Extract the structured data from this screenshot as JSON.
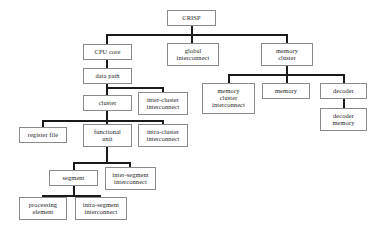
{
  "diagram": {
    "type": "tree",
    "background_color": "#ffffff",
    "box_border_color": "#8a8a8a",
    "edge_color": "#1a1a1a",
    "text_color": "#1c1c1c",
    "nodes": {
      "crisp": "CRISP",
      "cpu_core": "CPU core",
      "global_interconnect_l1": "global",
      "global_interconnect_l2": "interconnect",
      "memory_cluster_l1": "memory",
      "memory_cluster_l2": "cluster",
      "data_path": "data path",
      "memory_cluster_interconnect_l1": "memory",
      "memory_cluster_interconnect_l2": "cluster",
      "memory_cluster_interconnect_l3": "interconnect",
      "memory": "memory",
      "decoder": "decoder",
      "decoder_memory_l1": "decoder",
      "decoder_memory_l2": "memory",
      "cluster": "cluster",
      "inter_cluster_interconnect_l1": "inter-cluster",
      "inter_cluster_interconnect_l2": "interconnect",
      "register_file": "register file",
      "functional_unit_l1": "functional",
      "functional_unit_l2": "unit",
      "intra_cluster_interconnect_l1": "intra-cluster",
      "intra_cluster_interconnect_l2": "interconnect",
      "segment": "segment",
      "inter_segment_interconnect_l1": "inter-segment",
      "inter_segment_interconnect_l2": "interconnect",
      "processing_element_l1": "processing",
      "processing_element_l2": "element",
      "intra_segment_interconnect_l1": "intra-segment",
      "intra_segment_interconnect_l2": "interconnect"
    },
    "hierarchy": [
      {
        "parent": "CRISP",
        "children": [
          "CPU core",
          "global interconnect",
          "memory cluster"
        ]
      },
      {
        "parent": "CPU core",
        "children": [
          "data path"
        ]
      },
      {
        "parent": "data path",
        "children": [
          "cluster",
          "inter-cluster interconnect"
        ]
      },
      {
        "parent": "cluster",
        "children": [
          "register file",
          "functional unit",
          "intra-cluster interconnect"
        ]
      },
      {
        "parent": "functional unit",
        "children": [
          "segment",
          "inter-segment interconnect"
        ]
      },
      {
        "parent": "segment",
        "children": [
          "processing element",
          "intra-segment interconnect"
        ]
      },
      {
        "parent": "memory cluster",
        "children": [
          "memory cluster interconnect",
          "memory",
          "decoder"
        ]
      },
      {
        "parent": "decoder",
        "children": [
          "decoder memory"
        ]
      }
    ]
  }
}
